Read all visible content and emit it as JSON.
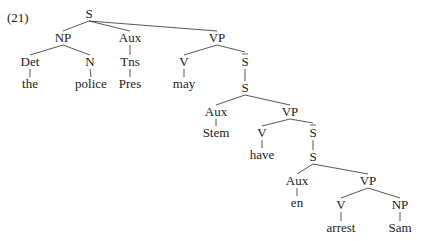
{
  "example_number": "(21)",
  "nodes": [
    {
      "id": "S0",
      "label": "S",
      "x": 89,
      "y": 18,
      "bar": false
    },
    {
      "id": "NP0",
      "label": "NP",
      "x": 63,
      "y": 42,
      "bar": false
    },
    {
      "id": "Aux0",
      "label": "Aux",
      "x": 130,
      "y": 42,
      "bar": false
    },
    {
      "id": "VP0",
      "label": "VP",
      "x": 217,
      "y": 42,
      "bar": false
    },
    {
      "id": "Det0",
      "label": "Det",
      "x": 30,
      "y": 66,
      "bar": false
    },
    {
      "id": "N0",
      "label": "N",
      "x": 90,
      "y": 66,
      "bar": false
    },
    {
      "id": "Tns0",
      "label": "Tns",
      "x": 130,
      "y": 66,
      "bar": false
    },
    {
      "id": "V0",
      "label": "V",
      "x": 184,
      "y": 66,
      "bar": false
    },
    {
      "id": "Sbar0",
      "label": "S",
      "x": 245,
      "y": 66,
      "bar": true
    },
    {
      "id": "the",
      "label": "the",
      "x": 30,
      "y": 88,
      "bar": false
    },
    {
      "id": "police",
      "label": "police",
      "x": 91,
      "y": 88,
      "bar": false
    },
    {
      "id": "Pres",
      "label": "Pres",
      "x": 130,
      "y": 88,
      "bar": false
    },
    {
      "id": "may",
      "label": "may",
      "x": 184,
      "y": 88,
      "bar": false
    },
    {
      "id": "S1",
      "label": "S",
      "x": 245,
      "y": 92,
      "bar": false
    },
    {
      "id": "Aux1",
      "label": "Aux",
      "x": 216,
      "y": 116,
      "bar": false
    },
    {
      "id": "VP1",
      "label": "VP",
      "x": 290,
      "y": 116,
      "bar": false
    },
    {
      "id": "Stem",
      "label": "Stem",
      "x": 216,
      "y": 137,
      "bar": false
    },
    {
      "id": "V1",
      "label": "V",
      "x": 262,
      "y": 137,
      "bar": false
    },
    {
      "id": "Sbar1",
      "label": "S",
      "x": 313,
      "y": 137,
      "bar": true
    },
    {
      "id": "have",
      "label": "have",
      "x": 262,
      "y": 159,
      "bar": false
    },
    {
      "id": "S2",
      "label": "S",
      "x": 313,
      "y": 161,
      "bar": false
    },
    {
      "id": "Aux2",
      "label": "Aux",
      "x": 297,
      "y": 185,
      "bar": false
    },
    {
      "id": "VP2",
      "label": "VP",
      "x": 368,
      "y": 185,
      "bar": false
    },
    {
      "id": "en",
      "label": "en",
      "x": 297,
      "y": 207,
      "bar": false
    },
    {
      "id": "V2",
      "label": "V",
      "x": 341,
      "y": 209,
      "bar": false
    },
    {
      "id": "NP2",
      "label": "NP",
      "x": 400,
      "y": 209,
      "bar": false
    },
    {
      "id": "arrest",
      "label": "arrest",
      "x": 341,
      "y": 232,
      "bar": false
    },
    {
      "id": "Sam",
      "label": "Sam",
      "x": 400,
      "y": 232,
      "bar": false
    }
  ],
  "edges": [
    [
      "S0",
      "NP0"
    ],
    [
      "S0",
      "Aux0"
    ],
    [
      "S0",
      "VP0"
    ],
    [
      "NP0",
      "Det0"
    ],
    [
      "NP0",
      "N0"
    ],
    [
      "Aux0",
      "Tns0"
    ],
    [
      "VP0",
      "V0"
    ],
    [
      "VP0",
      "Sbar0"
    ],
    [
      "Det0",
      "the"
    ],
    [
      "N0",
      "police"
    ],
    [
      "Tns0",
      "Pres"
    ],
    [
      "V0",
      "may"
    ],
    [
      "Sbar0",
      "S1"
    ],
    [
      "S1",
      "Aux1"
    ],
    [
      "S1",
      "VP1"
    ],
    [
      "Aux1",
      "Stem"
    ],
    [
      "VP1",
      "V1"
    ],
    [
      "VP1",
      "Sbar1"
    ],
    [
      "V1",
      "have"
    ],
    [
      "Sbar1",
      "S2"
    ],
    [
      "S2",
      "Aux2"
    ],
    [
      "S2",
      "VP2"
    ],
    [
      "Aux2",
      "en"
    ],
    [
      "VP2",
      "V2"
    ],
    [
      "VP2",
      "NP2"
    ],
    [
      "V2",
      "arrest"
    ],
    [
      "NP2",
      "Sam"
    ]
  ]
}
